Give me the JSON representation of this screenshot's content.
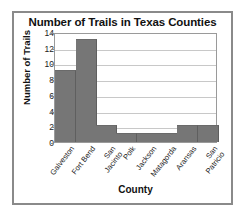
{
  "chart_data": {
    "type": "bar",
    "title": "Number of Trails in Texas Counties",
    "xlabel": "County",
    "ylabel": "Number of Trails",
    "categories": [
      "Galveston",
      "Fort Bend",
      "San\nJacinto",
      "Polk",
      "Jackson",
      "Matagorda",
      "Aransas",
      "San\nPatricio"
    ],
    "values": [
      9,
      13,
      2,
      1,
      1,
      1,
      2,
      2
    ],
    "ylim": [
      0,
      14
    ],
    "yticks": [
      0,
      2,
      4,
      6,
      8,
      10,
      12,
      14
    ],
    "ytick_labels": [
      "0",
      "2",
      "4",
      "6",
      "8",
      "10",
      "12",
      "14"
    ],
    "grid": true,
    "legend": false,
    "bar_color": "#767676",
    "grid_color": "#c8c8c8",
    "frame_color": "#8a8a8a",
    "background": "#ffffff"
  }
}
